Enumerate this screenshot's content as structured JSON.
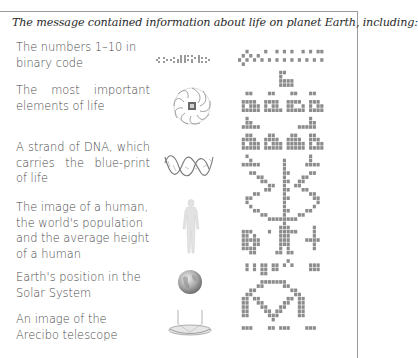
{
  "caption": "The message contained information about life on planet Earth, including:",
  "items": [
    {
      "label": "The numbers 1–10 in binary code",
      "icon": "binary-numbers-icon"
    },
    {
      "label": "The most important elements of life",
      "icon": "elements-wheel-icon"
    },
    {
      "label": "A strand of DNA, which carries the blue-print of life",
      "icon": "dna-strand-icon"
    },
    {
      "label": "The image of a human, the world's population and the average height of a human",
      "icon": "human-figure-icon"
    },
    {
      "label": "Earth's position in the Solar System",
      "icon": "earth-globe-icon"
    },
    {
      "label": "An image of the Arecibo telescope",
      "icon": "arecibo-telescope-icon"
    }
  ],
  "colors": {
    "text": "#4a4a4a",
    "caption": "#2a2a2a",
    "pixel": "#8c8c8c",
    "border": "#9a9a9a"
  },
  "arecibo_message": {
    "columns": 23,
    "cell": 3.75,
    "rows": [
      "00000000000000000000000",
      "00000000000000000000000",
      "00100001001010100101011",
      "01010100000000000000000",
      "10101010101010101010101",
      "01000000000000000000000",
      "00000000000000000000000",
      "00000000000110000000000",
      "00000000000100000000000",
      "00000000000111100000000",
      "00000000000111100000000",
      "00000000000000000000000",
      "00110000110000110001100",
      "00000000000000000000000",
      "01111001111001111001110",
      "01011101011001100101011",
      "01111101111101111101111",
      "00000000000000000000000",
      "00100000000000000001000",
      "00110000000000000001100",
      "01111100000000001111100",
      "00000000000000000000000",
      "00110000110000110001100",
      "01111001111001111001110",
      "01011101011101111101011",
      "01111101111101111101111",
      "00000000000000000000000",
      "00100000000000000001000",
      "00010000000010000001000",
      "01111100000010000011110",
      "00000000000010000000000",
      "00011000000011000001100",
      "00000110000010000110000",
      "00000011000011001100000",
      "00000000110010011000000",
      "00000001100011000110000",
      "00001100000010000001100",
      "00110000000011000000110",
      "00100000000010000000010",
      "00010000000010000000100",
      "00001100000011000011000",
      "00000011000010001100000",
      "00000000111111110000000",
      "00000000000010000000000",
      "00000000000111000000100",
      "01110000100111110000100",
      "01101000000111000000100",
      "01111100000111000011110",
      "01101100000111000000100",
      "01111000000101000000100",
      "00011000001101100000000",
      "00000000000000000000000",
      "00000000000001000000000",
      "00101011011010100001110",
      "00101011011000000001110",
      "00000011000000000000000",
      "00000000000000000000000",
      "00000011111110000000000",
      "00000110000011000000000",
      "00011000000000110000000",
      "00110000000000011000000",
      "01101100000001101100000",
      "01100110000011001100000",
      "01100011000110001100000",
      "01100001101100001100000",
      "01100000111000001100000",
      "00000000010000000000000",
      "00000000000000000000000",
      "01110000110111000011100",
      "00000000000000000000000"
    ]
  }
}
